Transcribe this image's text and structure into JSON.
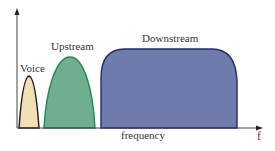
{
  "diagram": {
    "axis": {
      "x_label": "frequency",
      "x_symbol": "f",
      "colors": {
        "axis": "#444444",
        "symbol": "#8a2a2a"
      }
    },
    "bands": [
      {
        "name": "Voice",
        "label": "Voice",
        "fill": "#f2dfb6",
        "stroke": "#1a1a1a"
      },
      {
        "name": "Upstream",
        "label": "Upstream",
        "fill": "#6fae8f",
        "stroke": "#1f8a55"
      },
      {
        "name": "Downstream",
        "label": "Downstream",
        "fill": "#6f7bac",
        "stroke": "#1f2d6e"
      }
    ]
  }
}
